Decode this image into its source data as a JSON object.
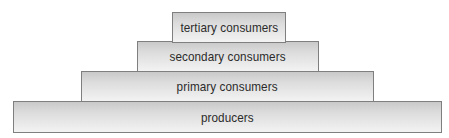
{
  "diagram": {
    "type": "trophic-pyramid",
    "levels": [
      {
        "label": "tertiary consumers",
        "rank": 4
      },
      {
        "label": "secondary consumers",
        "rank": 3
      },
      {
        "label": "primary consumers",
        "rank": 2
      },
      {
        "label": "producers",
        "rank": 1
      }
    ]
  },
  "colors": {
    "border": "#7f7f7f",
    "fill_top": "#c9c9c9",
    "fill_bottom": "#f3f3f3",
    "text": "#2b2b2b"
  }
}
